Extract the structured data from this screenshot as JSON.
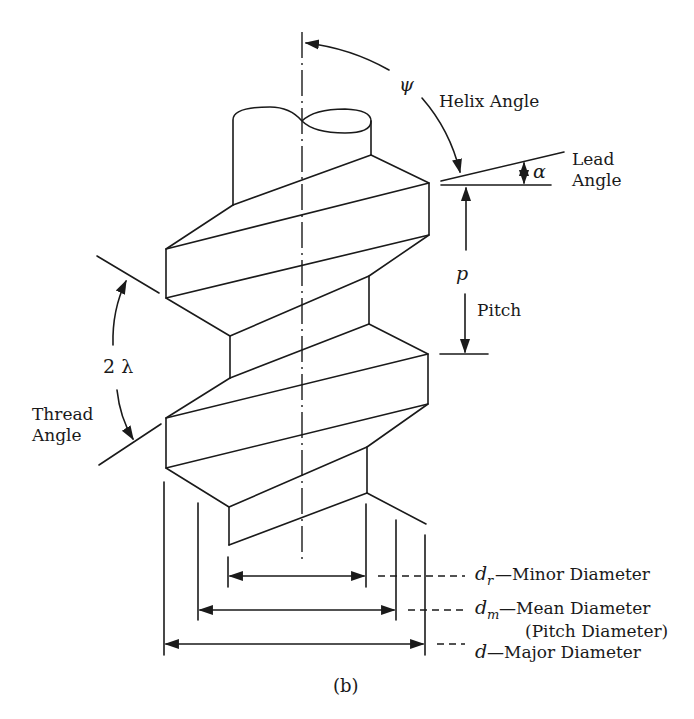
{
  "figure": {
    "caption": "(b)"
  },
  "labels": {
    "helix_angle": {
      "symbol": "ψ",
      "text": "Helix Angle"
    },
    "lead_angle": {
      "symbol": "α",
      "line1": "Lead",
      "line2": "Angle"
    },
    "pitch": {
      "symbol": "p",
      "text": "Pitch"
    },
    "thread_angle": {
      "symbol": "2 λ",
      "line1": "Thread",
      "line2": "Angle"
    },
    "minor_diameter": {
      "symbol": "d",
      "subscript": "r",
      "text": "—Minor Diameter"
    },
    "mean_diameter": {
      "symbol": "d",
      "subscript": "m",
      "text": "—Mean Diameter",
      "note": "(Pitch Diameter)"
    },
    "major_diameter": {
      "symbol": "d",
      "subscript": "",
      "text": "—Major Diameter"
    }
  },
  "colors": {
    "ink": "#1a1a1a",
    "background": "#ffffff"
  }
}
